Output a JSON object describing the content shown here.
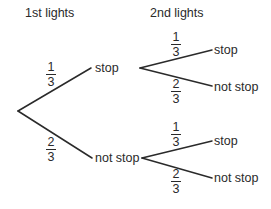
{
  "headings": {
    "first": "1st lights",
    "second": "2nd lights"
  },
  "colors": {
    "line": "#2a2a2a",
    "text": "#2a2a2a",
    "background": "#ffffff"
  },
  "tree": {
    "first_level": [
      {
        "outcome": "stop",
        "probability": {
          "num": "1",
          "den": "3"
        }
      },
      {
        "outcome": "not stop",
        "probability": {
          "num": "2",
          "den": "3"
        }
      }
    ],
    "second_level": {
      "after_stop": [
        {
          "outcome": "stop",
          "probability": {
            "num": "1",
            "den": "3"
          }
        },
        {
          "outcome": "not stop",
          "probability": {
            "num": "2",
            "den": "3"
          }
        }
      ],
      "after_not_stop": [
        {
          "outcome": "stop",
          "probability": {
            "num": "1",
            "den": "3"
          }
        },
        {
          "outcome": "not stop",
          "probability": {
            "num": "2",
            "den": "3"
          }
        }
      ]
    }
  }
}
